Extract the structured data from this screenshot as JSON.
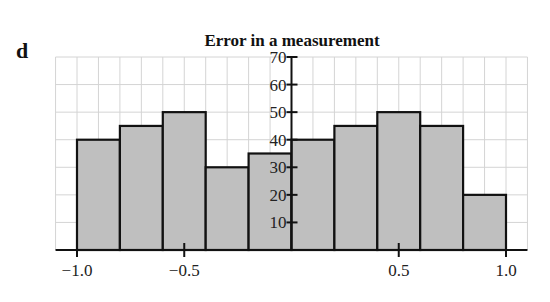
{
  "panel_label": "d",
  "chart_data": {
    "type": "bar",
    "subtype": "histogram",
    "title": "Error in a measurement",
    "xlabel": "",
    "ylabel": "",
    "bin_edges": [
      -1.0,
      -0.8,
      -0.6,
      -0.4,
      -0.2,
      0.0,
      0.2,
      0.4,
      0.6,
      0.8,
      1.0
    ],
    "categories": [
      "-1.0 to -0.8",
      "-0.8 to -0.6",
      "-0.6 to -0.4",
      "-0.4 to -0.2",
      "-0.2 to 0.0",
      "0.0 to 0.2",
      "0.2 to 0.4",
      "0.4 to 0.6",
      "0.6 to 0.8",
      "0.8 to 1.0"
    ],
    "values": [
      40,
      45,
      50,
      30,
      35,
      40,
      45,
      50,
      45,
      20
    ],
    "xlim": [
      -1.1,
      1.1
    ],
    "ylim": [
      0,
      70
    ],
    "x_ticks": [
      -1.0,
      -0.5,
      0.5,
      1.0
    ],
    "x_tick_labels": [
      "−1.0",
      "−0.5",
      "0.5",
      "1.0"
    ],
    "y_ticks": [
      10,
      20,
      30,
      40,
      50,
      60,
      70
    ],
    "y_tick_labels": [
      "10",
      "20",
      "30",
      "40",
      "50",
      "60",
      "70"
    ],
    "grid": true,
    "grid_x_step": 0.1,
    "grid_y_step": 10,
    "legend": null,
    "colors": {
      "bar_fill": "#bfbfbf",
      "bar_edge": "#111111",
      "grid": "#d4d4d4",
      "axis": "#111111"
    }
  }
}
